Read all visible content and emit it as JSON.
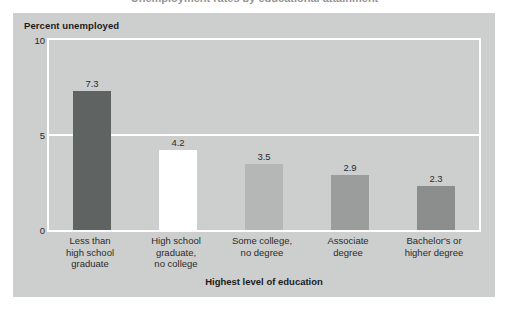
{
  "clipped_title": "Unemployment rates by educational attainment",
  "panel": {
    "background": "#cdcfce"
  },
  "chart_data": {
    "type": "bar",
    "title": "",
    "xlabel": "Highest level of education",
    "ylabel": "Percent unemployed",
    "ylim": [
      0,
      10
    ],
    "yticks": [
      "0",
      "5",
      "10"
    ],
    "ytick_values": [
      0,
      5,
      10
    ],
    "grid": true,
    "legend": "none",
    "categories": [
      "Less than\nhigh school\ngraduate",
      "High school\ngraduate,\nno college",
      "Some college,\nno degree",
      "Associate\ndegree",
      "Bachelor's or\nhigher degree"
    ],
    "values": [
      7.3,
      4.2,
      3.5,
      2.9,
      2.3
    ],
    "value_labels": [
      "7.3",
      "4.2",
      "3.5",
      "2.9",
      "2.3"
    ],
    "bar_colors": [
      "#5f6361",
      "#ffffff",
      "#b4b7b5",
      "#9a9d9b",
      "#8b8e8c"
    ]
  }
}
